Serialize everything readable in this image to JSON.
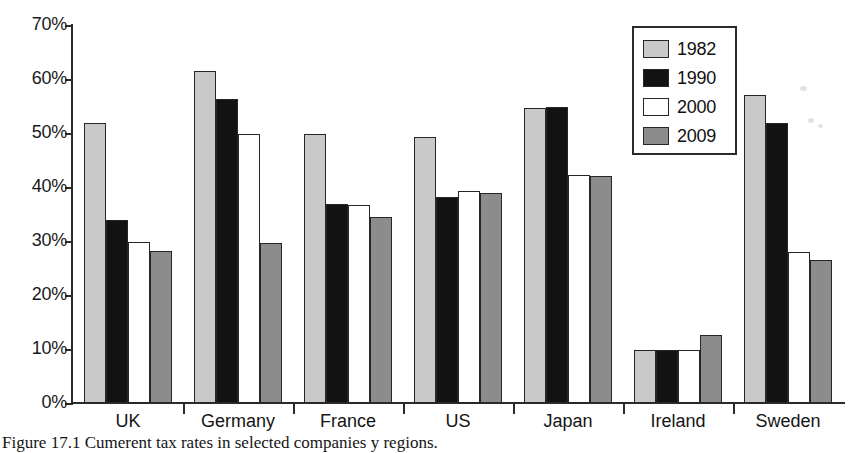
{
  "chart_data": {
    "type": "bar",
    "title": "",
    "xlabel": "",
    "ylabel": "",
    "categories": [
      "UK",
      "Germany",
      "France",
      "US",
      "Japan",
      "Ireland",
      "Sweden"
    ],
    "series": [
      {
        "name": "1982",
        "color": "#c9c9c9",
        "values": [
          51.8,
          61.5,
          49.9,
          49.3,
          54.7,
          9.9,
          57.0
        ]
      },
      {
        "name": "1990",
        "color": "#121212",
        "values": [
          33.8,
          56.3,
          36.9,
          38.2,
          54.8,
          9.8,
          51.8
        ]
      },
      {
        "name": "2000",
        "color": "#ffffff",
        "values": [
          29.8,
          49.8,
          36.7,
          39.3,
          42.3,
          9.9,
          28.0
        ]
      },
      {
        "name": "2009",
        "color": "#8c8c8c",
        "values": [
          28.2,
          29.6,
          34.5,
          38.9,
          42.0,
          12.6,
          26.4
        ]
      }
    ],
    "ylim": [
      0,
      70
    ],
    "ytick_values": [
      0,
      10,
      20,
      30,
      40,
      50,
      60,
      70
    ],
    "ytick_labels": [
      "0%",
      "10%",
      "20%",
      "30%",
      "40%",
      "50%",
      "60%",
      "70%"
    ],
    "grid": false,
    "legend_position": "top-right",
    "legend_entries": [
      "1982",
      "1990",
      "2000",
      "2009"
    ]
  },
  "caption": {
    "text": "Figure 17.1  Cumerent tax rates in selected companies y regions."
  }
}
